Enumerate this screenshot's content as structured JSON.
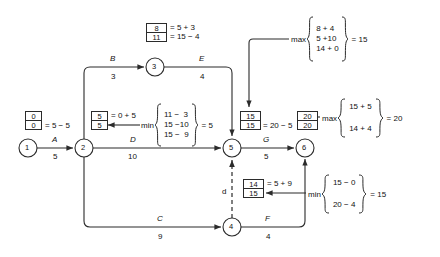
{
  "diagram": {
    "nodes": [
      {
        "id": "1",
        "label": "1",
        "cx": 28,
        "cy": 148
      },
      {
        "id": "2",
        "label": "2",
        "cx": 84,
        "cy": 148
      },
      {
        "id": "3",
        "label": "3",
        "cx": 155,
        "cy": 67
      },
      {
        "id": "4",
        "label": "4",
        "cx": 232,
        "cy": 227
      },
      {
        "id": "5",
        "label": "5",
        "cx": 232,
        "cy": 148
      },
      {
        "id": "6",
        "label": "6",
        "cx": 305,
        "cy": 148
      }
    ],
    "edges": [
      {
        "name": "A",
        "duration": "5",
        "from": "1",
        "to": "2"
      },
      {
        "name": "B",
        "duration": "3",
        "from": "2",
        "to": "3"
      },
      {
        "name": "C",
        "duration": "9",
        "from": "2",
        "to": "4"
      },
      {
        "name": "D",
        "duration": "10",
        "from": "2",
        "to": "5"
      },
      {
        "name": "E",
        "duration": "4",
        "from": "3",
        "to": "5"
      },
      {
        "name": "F",
        "duration": "4",
        "from": "4",
        "to": "6"
      },
      {
        "name": "G",
        "duration": "5",
        "from": "5",
        "to": "6"
      }
    ],
    "dummy_edge": {
      "label": "d",
      "from": "4",
      "to": "5",
      "style": "dashed"
    },
    "node_boxes": [
      {
        "node": "1",
        "early": "0",
        "late": "0",
        "note": "= 5 − 5"
      },
      {
        "node": "2",
        "early": "5",
        "late": "5",
        "note_top": "= 0 + 5"
      },
      {
        "node": "3",
        "early": "8",
        "late": "11",
        "note_top": "= 5 + 3",
        "note_bottom": "= 15 − 4"
      },
      {
        "node": "4",
        "early": "14",
        "late": "15",
        "note_top": "= 5 + 9"
      },
      {
        "node": "5",
        "early": "15",
        "late": "15",
        "note": "= 20 − 5"
      },
      {
        "node": "6",
        "early": "20",
        "late": "20"
      }
    ],
    "computations": [
      {
        "id": "node5-early",
        "op": "max",
        "terms": [
          "8 + 4",
          "5 +10",
          "14 + 0"
        ],
        "result": "= 15"
      },
      {
        "id": "node6-early",
        "op": "max",
        "terms": [
          "15 + 5",
          "14 + 4"
        ],
        "result": "= 20"
      },
      {
        "id": "node2-late",
        "op": "min",
        "terms": [
          "11 −  3",
          "15 −10",
          "15 −  9"
        ],
        "result": "= 5"
      },
      {
        "id": "node4-late",
        "op": "min",
        "terms": [
          "15 − 0",
          "20 − 4"
        ],
        "result": "= 15"
      }
    ],
    "colors": {
      "line": "#2b2b2b",
      "text": "#111111",
      "background": "#ffffff",
      "box_border": "#2b2b2b"
    }
  }
}
